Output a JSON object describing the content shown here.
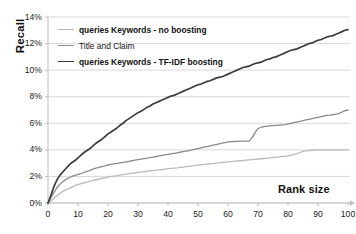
{
  "chart_data": {
    "type": "line",
    "title": "",
    "xlabel": "Rank size",
    "ylabel": "Recall",
    "xlim": [
      0,
      100
    ],
    "ylim": [
      0,
      14
    ],
    "grid": true,
    "legend_position": "top-left",
    "y_tick_labels": [
      "0%",
      "2%",
      "4%",
      "6%",
      "8%",
      "10%",
      "12%",
      "14%"
    ],
    "y_tick_values": [
      0,
      2,
      4,
      6,
      8,
      10,
      12,
      14
    ],
    "x_tick_labels": [
      "0",
      "10",
      "20",
      "30",
      "40",
      "50",
      "60",
      "70",
      "80",
      "90",
      "100"
    ],
    "x_tick_values": [
      0,
      10,
      20,
      30,
      40,
      50,
      60,
      70,
      80,
      90,
      100
    ],
    "x": [
      0,
      1,
      2,
      3,
      4,
      5,
      6,
      7,
      8,
      9,
      10,
      11,
      12,
      13,
      14,
      15,
      16,
      17,
      18,
      19,
      20,
      21,
      22,
      23,
      24,
      25,
      26,
      27,
      28,
      29,
      30,
      31,
      32,
      33,
      34,
      35,
      36,
      37,
      38,
      39,
      40,
      41,
      42,
      43,
      44,
      45,
      46,
      47,
      48,
      49,
      50,
      51,
      52,
      53,
      54,
      55,
      56,
      57,
      58,
      59,
      60,
      61,
      62,
      63,
      64,
      65,
      66,
      67,
      68,
      69,
      70,
      71,
      72,
      73,
      74,
      75,
      76,
      77,
      78,
      79,
      80,
      81,
      82,
      83,
      84,
      85,
      86,
      87,
      88,
      89,
      90,
      91,
      92,
      93,
      94,
      95,
      96,
      97,
      98,
      99,
      100
    ],
    "series": [
      {
        "name": "queries Keywords - no boosting",
        "color": "#b9b9b9",
        "width": 1.3,
        "values": [
          0,
          0.15,
          0.35,
          0.55,
          0.72,
          0.88,
          1.0,
          1.1,
          1.2,
          1.3,
          1.38,
          1.45,
          1.52,
          1.58,
          1.64,
          1.7,
          1.75,
          1.8,
          1.85,
          1.9,
          1.95,
          2.0,
          2.03,
          2.06,
          2.1,
          2.14,
          2.18,
          2.21,
          2.24,
          2.27,
          2.3,
          2.33,
          2.36,
          2.39,
          2.42,
          2.45,
          2.47,
          2.5,
          2.52,
          2.55,
          2.58,
          2.6,
          2.63,
          2.65,
          2.68,
          2.7,
          2.73,
          2.76,
          2.79,
          2.82,
          2.85,
          2.88,
          2.9,
          2.92,
          2.95,
          2.97,
          3.0,
          3.02,
          3.05,
          3.07,
          3.1,
          3.12,
          3.14,
          3.16,
          3.18,
          3.2,
          3.23,
          3.25,
          3.27,
          3.29,
          3.31,
          3.33,
          3.35,
          3.37,
          3.4,
          3.42,
          3.45,
          3.47,
          3.5,
          3.52,
          3.55,
          3.6,
          3.65,
          3.72,
          3.8,
          3.88,
          3.92,
          3.95,
          3.97,
          3.98,
          4.0,
          4.0,
          4.0,
          4.0,
          4.0,
          4.0,
          4.0,
          4.0,
          4.0,
          4.0,
          4.0
        ]
      },
      {
        "name": "Title and Claim",
        "color": "#8a8a8a",
        "width": 1.3,
        "values": [
          0,
          0.4,
          0.8,
          1.15,
          1.42,
          1.62,
          1.78,
          1.9,
          2.0,
          2.08,
          2.15,
          2.22,
          2.3,
          2.38,
          2.46,
          2.55,
          2.62,
          2.68,
          2.74,
          2.8,
          2.86,
          2.9,
          2.94,
          2.98,
          3.02,
          3.06,
          3.1,
          3.14,
          3.18,
          3.22,
          3.26,
          3.3,
          3.34,
          3.38,
          3.42,
          3.46,
          3.5,
          3.54,
          3.58,
          3.62,
          3.66,
          3.7,
          3.74,
          3.78,
          3.82,
          3.86,
          3.9,
          3.95,
          4.0,
          4.05,
          4.1,
          4.15,
          4.2,
          4.25,
          4.3,
          4.35,
          4.4,
          4.45,
          4.5,
          4.55,
          4.6,
          4.62,
          4.63,
          4.64,
          4.65,
          4.65,
          4.65,
          4.66,
          4.9,
          5.3,
          5.6,
          5.7,
          5.75,
          5.78,
          5.8,
          5.82,
          5.84,
          5.86,
          5.88,
          5.9,
          5.95,
          6.0,
          6.05,
          6.1,
          6.15,
          6.2,
          6.25,
          6.3,
          6.35,
          6.4,
          6.45,
          6.5,
          6.55,
          6.6,
          6.62,
          6.65,
          6.68,
          6.75,
          6.85,
          6.95,
          7.0
        ]
      },
      {
        "name": "queries Keywords - TF-IDF boosting",
        "color": "#3c3c3c",
        "width": 1.7,
        "values": [
          0,
          0.6,
          1.25,
          1.75,
          2.1,
          2.35,
          2.6,
          2.85,
          3.05,
          3.2,
          3.4,
          3.6,
          3.8,
          3.95,
          4.1,
          4.3,
          4.5,
          4.65,
          4.8,
          5.0,
          5.2,
          5.35,
          5.5,
          5.65,
          5.85,
          6.0,
          6.2,
          6.35,
          6.5,
          6.65,
          6.8,
          6.9,
          7.05,
          7.2,
          7.3,
          7.45,
          7.55,
          7.65,
          7.75,
          7.85,
          7.95,
          8.05,
          8.1,
          8.2,
          8.3,
          8.4,
          8.5,
          8.6,
          8.7,
          8.8,
          8.9,
          8.95,
          9.05,
          9.15,
          9.2,
          9.3,
          9.4,
          9.45,
          9.5,
          9.6,
          9.7,
          9.8,
          9.9,
          10.0,
          10.1,
          10.2,
          10.25,
          10.3,
          10.4,
          10.5,
          10.55,
          10.6,
          10.7,
          10.8,
          10.85,
          10.95,
          11.0,
          11.1,
          11.2,
          11.3,
          11.4,
          11.5,
          11.55,
          11.6,
          11.7,
          11.8,
          11.9,
          12.0,
          12.05,
          12.15,
          12.25,
          12.3,
          12.4,
          12.5,
          12.55,
          12.6,
          12.7,
          12.8,
          12.9,
          13.0,
          13.05
        ]
      }
    ]
  },
  "axes": {
    "y_title": "Recall",
    "x_title": "Rank size"
  },
  "legend": {
    "items": [
      {
        "label": "queries Keywords - no boosting",
        "color": "#b9b9b9"
      },
      {
        "label": "Title and Claim",
        "color": "#8a8a8a"
      },
      {
        "label": "queries Keywords - TF-IDF boosting",
        "color": "#3c3c3c"
      }
    ]
  },
  "colors": {
    "grid": "#d9d9d9",
    "axis": "#bfbfbf",
    "text": "#111111",
    "background": "#ffffff"
  }
}
